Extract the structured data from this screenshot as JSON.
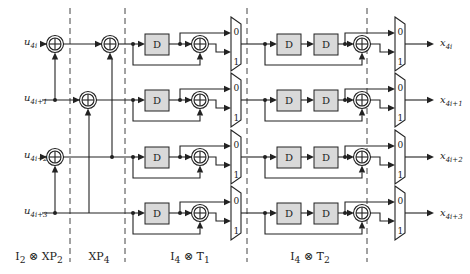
{
  "diagram": {
    "type": "hardware-block-diagram",
    "inputs": [
      {
        "base": "u",
        "sub": "4i"
      },
      {
        "base": "u",
        "sub": "4i+1"
      },
      {
        "base": "u",
        "sub": "4i+2"
      },
      {
        "base": "u",
        "sub": "4i+3"
      }
    ],
    "outputs": [
      {
        "base": "x",
        "sub": "4i"
      },
      {
        "base": "x",
        "sub": "4i+1"
      },
      {
        "base": "x",
        "sub": "4i+2"
      },
      {
        "base": "x",
        "sub": "4i+3"
      }
    ],
    "stages": [
      {
        "label_html": "I<sub>2</sub> ⊗ XP<sub>2</sub>",
        "label_text": "I2 ⊗ XP2"
      },
      {
        "label_html": "XP<sub>4</sub>",
        "label_text": "XP4"
      },
      {
        "label_html": "I<sub>4</sub> ⊗ T<sub>1</sub>",
        "label_text": "I4 ⊗ T1"
      },
      {
        "label_html": "I<sub>4</sub> ⊗ T<sub>2</sub>",
        "label_text": "I4 ⊗ T2"
      }
    ],
    "delay_label": "D",
    "mux_labels": [
      "0",
      "1"
    ],
    "xor_symbol": "⊕",
    "colors": {
      "line": "#222222",
      "delay_fill": "#d9d9d9",
      "background": "#ffffff"
    }
  }
}
